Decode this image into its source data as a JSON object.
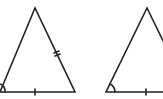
{
  "diagram": {
    "type": "geometry",
    "stroke_color": "#222222",
    "background": "#ffffff",
    "triangles": [
      {
        "id": "left",
        "vertices": {
          "apex": [
            35,
            8
          ],
          "bottom_left": [
            0,
            92
          ],
          "bottom_right": [
            75,
            92
          ]
        },
        "markings": {
          "angle_arc": "bottom_left",
          "base_tick": "single",
          "right_side_tick": "double"
        }
      },
      {
        "id": "right",
        "vertices": {
          "apex": [
            147,
            8
          ],
          "bottom_left": [
            106,
            92
          ],
          "bottom_right": [
            188,
            92
          ]
        },
        "markings": {
          "angle_arc": "bottom_left",
          "base_tick": "single"
        }
      }
    ]
  }
}
